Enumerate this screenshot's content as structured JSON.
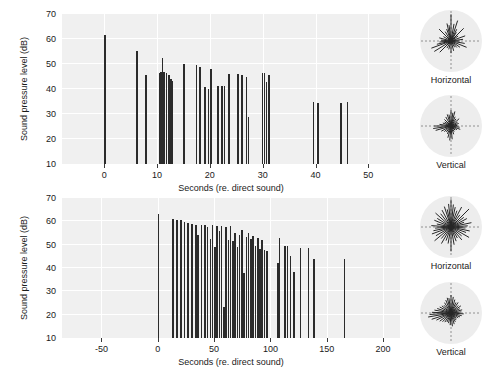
{
  "figure": {
    "width": 501,
    "height": 371,
    "background": "#ffffff",
    "plot_background": "#f0f0f0",
    "grid_color": "#ffffff",
    "bar_color": "#2b2b2b",
    "polar_disc_color": "#ededed"
  },
  "chart_data": [
    {
      "id": "top-panel",
      "type": "bar",
      "title": "",
      "xlabel": "Seconds (re. direct sound)",
      "ylabel": "Sound pressure level (dB)",
      "xlim": [
        -8,
        56
      ],
      "ylim": [
        10,
        70
      ],
      "grid": true,
      "xticks": [
        0,
        10,
        20,
        30,
        40,
        50
      ],
      "xticklabels": [
        "0",
        "10",
        "20",
        "30",
        "40",
        "50"
      ],
      "yticks": [
        10,
        20,
        30,
        40,
        50,
        60,
        70
      ],
      "yticklabels": [
        "10",
        "20",
        "30",
        "40",
        "50",
        "60",
        "70"
      ],
      "legend_position": "none",
      "x": [
        0.0,
        6.0,
        7.7,
        10.3,
        10.6,
        10.9,
        11.2,
        11.6,
        12.1,
        12.5,
        12.8,
        15.0,
        17.3,
        18.0,
        18.9,
        19.6,
        20.1,
        21.4,
        22.2,
        22.6,
        23.5,
        25.2,
        25.9,
        26.8,
        27.2,
        29.8,
        30.2,
        30.6,
        31.1,
        39.5,
        40.3,
        44.7,
        45.9
      ],
      "y": [
        61.5,
        55.2,
        45.8,
        46.5,
        46.8,
        52.6,
        46.9,
        46.3,
        45.8,
        44.2,
        43.4,
        50.0,
        49.5,
        49.0,
        41.0,
        40.0,
        48.0,
        41.4,
        41.3,
        41.2,
        46.0,
        46.1,
        45.7,
        44.9,
        28.7,
        46.3,
        46.4,
        43.0,
        45.6,
        35.0,
        34.6,
        34.5,
        35.0
      ]
    },
    {
      "id": "bottom-panel",
      "type": "bar",
      "title": "",
      "xlabel": "Seconds (re. direct sound)",
      "ylabel": "Sound pressure level (dB)",
      "xlim": [
        -85,
        215
      ],
      "ylim": [
        10,
        70
      ],
      "grid": true,
      "xticks": [
        -50,
        0,
        50,
        100,
        150,
        200
      ],
      "xticklabels": [
        "-50",
        "0",
        "50",
        "100",
        "150",
        "200"
      ],
      "yticks": [
        10,
        20,
        30,
        40,
        50,
        60,
        70
      ],
      "yticklabels": [
        "10",
        "20",
        "30",
        "40",
        "50",
        "60",
        "70"
      ],
      "legend_position": "none",
      "x": [
        0.0,
        13.0,
        16.5,
        20.0,
        23.0,
        26.0,
        29.5,
        33.0,
        35.0,
        38.0,
        41.0,
        43.5,
        46.0,
        48.0,
        50.0,
        52.0,
        54.0,
        56.0,
        58.0,
        60.0,
        62.0,
        64.0,
        66.0,
        68.0,
        70.0,
        72.0,
        74.0,
        76.0,
        78.0,
        80.0,
        82.0,
        84.0,
        86.0,
        88.0,
        90.0,
        92.0,
        94.0,
        96.0,
        106.0,
        107.5,
        112.0,
        114.5,
        117.0,
        120.0,
        126.0,
        133.0,
        138.0,
        165.0
      ],
      "y": [
        63.0,
        61.0,
        60.6,
        60.5,
        59.6,
        59.4,
        58.8,
        58.5,
        54.2,
        58.3,
        58.6,
        57.5,
        52.5,
        58.3,
        49.2,
        57.8,
        56.0,
        58.2,
        23.5,
        57.5,
        52.0,
        57.8,
        51.5,
        55.0,
        49.0,
        54.3,
        56.2,
        38.0,
        53.5,
        55.0,
        52.5,
        53.6,
        49.5,
        53.0,
        48.0,
        52.0,
        47.8,
        47.2,
        42.0,
        53.0,
        49.5,
        49.6,
        45.0,
        38.5,
        48.5,
        48.5,
        44.0,
        44.0
      ]
    }
  ],
  "polar_plots": [
    {
      "id": "top-horizontal",
      "caption": "Horizontal",
      "panel": "top",
      "rays": [
        [
          90,
          0.92
        ],
        [
          97,
          0.55
        ],
        [
          80,
          0.6
        ],
        [
          72,
          0.74
        ],
        [
          64,
          0.45
        ],
        [
          58,
          0.35
        ],
        [
          45,
          0.62
        ],
        [
          35,
          0.3
        ],
        [
          20,
          0.52
        ],
        [
          8,
          0.42
        ],
        [
          0,
          0.3
        ],
        [
          350,
          0.48
        ],
        [
          338,
          0.58
        ],
        [
          325,
          0.38
        ],
        [
          312,
          0.3
        ],
        [
          300,
          0.25
        ],
        [
          285,
          0.35
        ],
        [
          270,
          0.42
        ],
        [
          255,
          0.3
        ],
        [
          240,
          0.28
        ],
        [
          225,
          0.55
        ],
        [
          212,
          0.68
        ],
        [
          200,
          0.72
        ],
        [
          193,
          0.5
        ],
        [
          185,
          0.4
        ],
        [
          175,
          0.35
        ],
        [
          165,
          0.42
        ],
        [
          150,
          0.3
        ],
        [
          135,
          0.58
        ],
        [
          122,
          0.38
        ],
        [
          110,
          0.44
        ],
        [
          103,
          0.62
        ]
      ]
    },
    {
      "id": "top-vertical",
      "caption": "Vertical",
      "panel": "top",
      "rays": [
        [
          90,
          0.55
        ],
        [
          100,
          0.4
        ],
        [
          82,
          0.46
        ],
        [
          75,
          0.52
        ],
        [
          66,
          0.35
        ],
        [
          55,
          0.3
        ],
        [
          42,
          0.38
        ],
        [
          30,
          0.26
        ],
        [
          18,
          0.28
        ],
        [
          5,
          0.22
        ],
        [
          352,
          0.3
        ],
        [
          340,
          0.34
        ],
        [
          328,
          0.24
        ],
        [
          315,
          0.2
        ],
        [
          300,
          0.22
        ],
        [
          288,
          0.3
        ],
        [
          275,
          0.46
        ],
        [
          265,
          0.5
        ],
        [
          255,
          0.42
        ],
        [
          245,
          0.3
        ],
        [
          232,
          0.26
        ],
        [
          220,
          0.3
        ],
        [
          208,
          0.38
        ],
        [
          196,
          0.55
        ],
        [
          188,
          0.62
        ],
        [
          180,
          0.58
        ],
        [
          172,
          0.4
        ],
        [
          160,
          0.3
        ],
        [
          148,
          0.26
        ],
        [
          135,
          0.32
        ],
        [
          120,
          0.36
        ],
        [
          108,
          0.42
        ]
      ]
    },
    {
      "id": "bottom-horizontal",
      "caption": "Horizontal",
      "panel": "bottom",
      "rays": [
        [
          90,
          0.95
        ],
        [
          96,
          0.8
        ],
        [
          84,
          0.78
        ],
        [
          78,
          0.7
        ],
        [
          70,
          0.6
        ],
        [
          62,
          0.78
        ],
        [
          54,
          0.52
        ],
        [
          45,
          0.88
        ],
        [
          37,
          0.55
        ],
        [
          28,
          0.62
        ],
        [
          20,
          0.48
        ],
        [
          12,
          0.72
        ],
        [
          4,
          0.58
        ],
        [
          356,
          0.5
        ],
        [
          348,
          0.66
        ],
        [
          340,
          0.55
        ],
        [
          330,
          0.72
        ],
        [
          320,
          0.48
        ],
        [
          310,
          0.58
        ],
        [
          300,
          0.44
        ],
        [
          290,
          0.52
        ],
        [
          280,
          0.62
        ],
        [
          270,
          0.84
        ],
        [
          260,
          0.58
        ],
        [
          250,
          0.5
        ],
        [
          240,
          0.66
        ],
        [
          230,
          0.52
        ],
        [
          220,
          0.74
        ],
        [
          210,
          0.6
        ],
        [
          200,
          0.7
        ],
        [
          192,
          0.62
        ],
        [
          184,
          0.55
        ],
        [
          176,
          0.68
        ],
        [
          168,
          0.5
        ],
        [
          158,
          0.62
        ],
        [
          148,
          0.56
        ],
        [
          138,
          0.72
        ],
        [
          128,
          0.58
        ],
        [
          118,
          0.66
        ],
        [
          108,
          0.74
        ],
        [
          102,
          0.62
        ]
      ]
    },
    {
      "id": "bottom-vertical",
      "caption": "Vertical",
      "panel": "bottom",
      "rays": [
        [
          90,
          0.62
        ],
        [
          98,
          0.52
        ],
        [
          82,
          0.56
        ],
        [
          74,
          0.48
        ],
        [
          65,
          0.4
        ],
        [
          56,
          0.44
        ],
        [
          46,
          0.36
        ],
        [
          36,
          0.42
        ],
        [
          26,
          0.34
        ],
        [
          16,
          0.4
        ],
        [
          6,
          0.36
        ],
        [
          356,
          0.44
        ],
        [
          346,
          0.38
        ],
        [
          336,
          0.34
        ],
        [
          326,
          0.3
        ],
        [
          316,
          0.26
        ],
        [
          306,
          0.3
        ],
        [
          296,
          0.34
        ],
        [
          286,
          0.4
        ],
        [
          276,
          0.46
        ],
        [
          266,
          0.42
        ],
        [
          256,
          0.36
        ],
        [
          246,
          0.34
        ],
        [
          236,
          0.38
        ],
        [
          226,
          0.42
        ],
        [
          216,
          0.48
        ],
        [
          206,
          0.56
        ],
        [
          198,
          0.7
        ],
        [
          190,
          0.8
        ],
        [
          184,
          0.74
        ],
        [
          178,
          0.66
        ],
        [
          170,
          0.58
        ],
        [
          162,
          0.5
        ],
        [
          152,
          0.44
        ],
        [
          142,
          0.4
        ],
        [
          132,
          0.36
        ],
        [
          122,
          0.42
        ],
        [
          112,
          0.48
        ],
        [
          104,
          0.54
        ]
      ]
    }
  ]
}
